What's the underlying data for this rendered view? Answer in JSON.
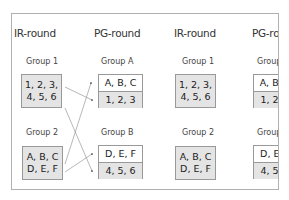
{
  "columns": [
    {
      "type": "ir",
      "header": "IR-round",
      "groups": [
        {
          "label": "Group 1",
          "lines": [
            "1, 2, 3,",
            "4, 5, 6"
          ]
        },
        {
          "label": "Group 2",
          "lines": [
            "A, B, C",
            "D, E, F"
          ]
        }
      ]
    },
    {
      "type": "pg",
      "header": "PG-round",
      "groups": [
        {
          "label": "Group A",
          "top": "A, B, C",
          "bottom": "1, 2, 3"
        },
        {
          "label": "Group B",
          "top": "D, E, F",
          "bottom": "4, 5, 6"
        }
      ]
    },
    {
      "type": "ir",
      "header": "IR-round",
      "groups": [
        {
          "label": "Group 1",
          "lines": [
            "1, 2, 3,",
            "4, 5, 6"
          ]
        },
        {
          "label": "Group 2",
          "lines": [
            "A, B, C",
            "D, E, F"
          ]
        }
      ]
    },
    {
      "type": "pg",
      "header": "PG-round",
      "groups": [
        {
          "label": "Group A",
          "top": "A, B, C",
          "bottom": "1, 2, 3"
        },
        {
          "label": "Group B",
          "top": "D, E, F",
          "bottom": "4, 5, 6"
        }
      ]
    }
  ],
  "arrows": [
    {
      "from": "col0.group1",
      "to": "col1.groupA.bottom"
    },
    {
      "from": "col0.group1",
      "to": "col1.groupB.bottom"
    },
    {
      "from": "col0.group2",
      "to": "col1.groupA.top"
    },
    {
      "from": "col0.group2",
      "to": "col1.groupB.top"
    }
  ]
}
